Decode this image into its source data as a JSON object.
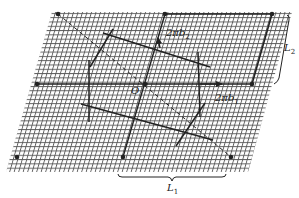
{
  "figure": {
    "labels": {
      "origin": "O",
      "b1_prefix": "2πb",
      "b1_sub": "1",
      "b2_prefix": "2πb",
      "b2_sub": "2",
      "L1_prefix": "L",
      "L1_sub": "1",
      "L2_prefix": "L",
      "L2_sub": "2"
    },
    "colors": {
      "ink": "#222222",
      "grid": "#555555",
      "background": "#ffffff"
    },
    "lattice_points": [
      [
        58,
        14
      ],
      [
        165,
        14
      ],
      [
        272,
        14
      ],
      [
        37,
        84
      ],
      [
        145,
        84
      ],
      [
        252,
        84
      ],
      [
        17,
        157
      ],
      [
        123,
        157
      ],
      [
        231,
        157
      ]
    ]
  }
}
